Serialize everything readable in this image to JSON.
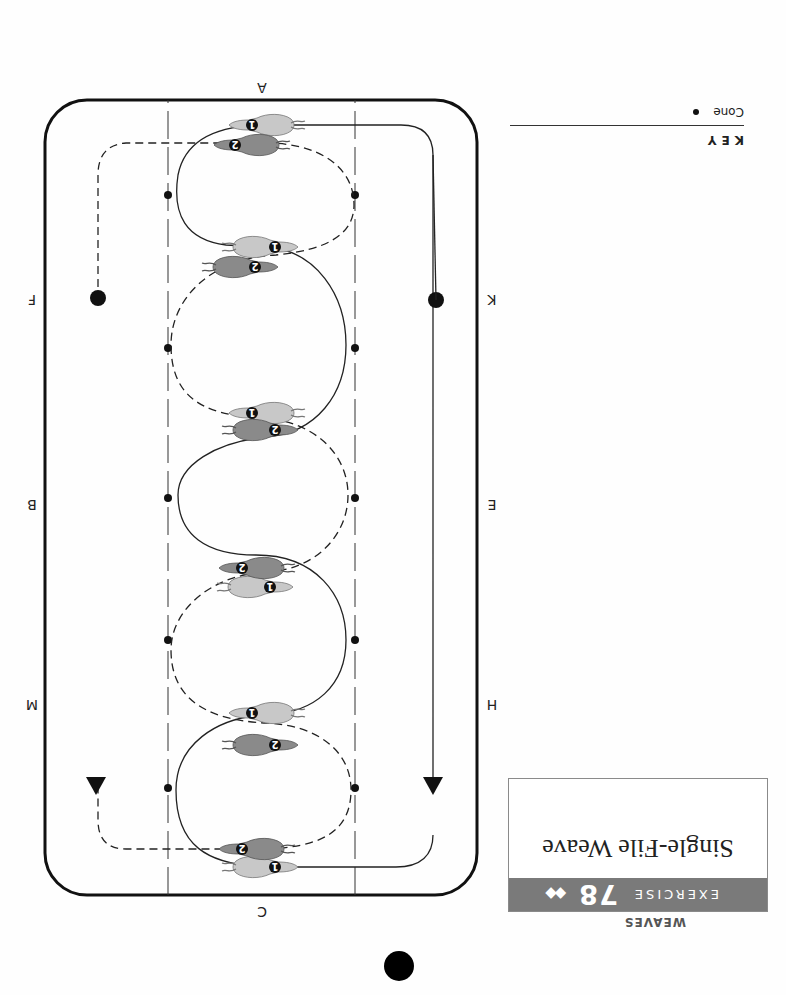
{
  "header": {
    "section": "WEAVES",
    "exercise_word": "EXERCISE",
    "exercise_number": "78",
    "difficulty": "◆◆",
    "title": "Single-File Weave"
  },
  "key": {
    "title": "KEY",
    "items": [
      {
        "label": "Cone",
        "symbol": "cone-dot"
      }
    ]
  },
  "arena": {
    "letters": {
      "top": "C",
      "bottom": "A",
      "left_top": "H",
      "left_mid": "E",
      "left_bottom": "K",
      "right_top": "M",
      "right_mid": "B",
      "right_bottom": "F"
    },
    "riders": [
      "1",
      "2"
    ],
    "paths": {
      "rider_1": "solid",
      "rider_2": "dashed"
    },
    "cone_rows": 5,
    "cone_columns": 2,
    "colors": {
      "rider_1": "#c8c8c8",
      "rider_2": "#8a8a8a",
      "line": "#222222",
      "banner": "#7a7a7a"
    }
  },
  "orientation": "rotated 180 degrees"
}
